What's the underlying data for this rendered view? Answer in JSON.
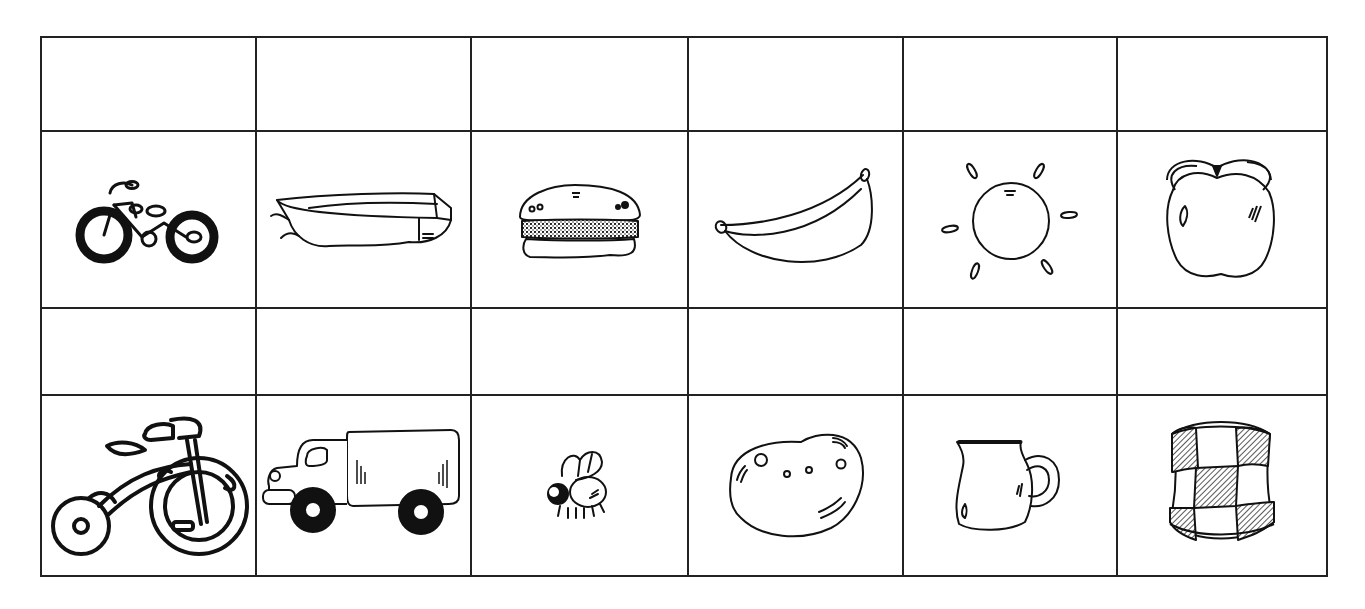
{
  "worksheet": {
    "layout": {
      "columns": 6,
      "rows": 4,
      "border_color": "#222222",
      "background": "#ffffff"
    },
    "sections": [
      {
        "answer_row": {
          "cells": [
            "",
            "",
            "",
            "",
            "",
            ""
          ]
        },
        "picture_row": {
          "items": [
            {
              "name": "bicycle",
              "icon": "bicycle-icon"
            },
            {
              "name": "boat",
              "icon": "boat-icon"
            },
            {
              "name": "hamburger",
              "icon": "hamburger-icon"
            },
            {
              "name": "banana",
              "icon": "banana-icon"
            },
            {
              "name": "sun",
              "icon": "sun-icon"
            },
            {
              "name": "apple",
              "icon": "apple-icon"
            }
          ]
        }
      },
      {
        "answer_row": {
          "cells": [
            "",
            "",
            "",
            "",
            "",
            ""
          ]
        },
        "picture_row": {
          "items": [
            {
              "name": "tricycle",
              "icon": "tricycle-icon"
            },
            {
              "name": "truck",
              "icon": "truck-icon"
            },
            {
              "name": "fly",
              "icon": "fly-icon"
            },
            {
              "name": "potato",
              "icon": "potato-icon"
            },
            {
              "name": "jug",
              "icon": "jug-icon"
            },
            {
              "name": "checkered drum",
              "icon": "drum-icon"
            }
          ]
        }
      }
    ]
  }
}
